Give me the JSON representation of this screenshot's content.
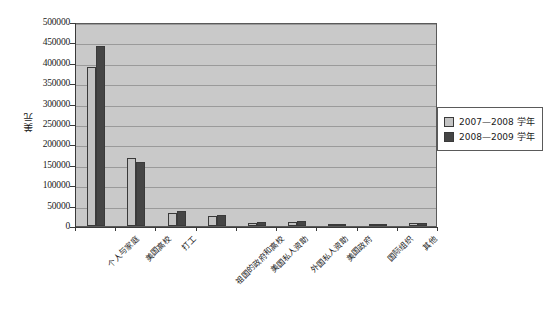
{
  "chart_data": {
    "type": "bar",
    "title": "",
    "xlabel": "",
    "ylabel": "美元",
    "ylim": [
      0,
      500000
    ],
    "ytick_labels": [
      "500000",
      "450000",
      "400000",
      "350000",
      "300000",
      "250000",
      "200000",
      "150000",
      "100000",
      "50000",
      "0"
    ],
    "ytick_values": [
      500000,
      450000,
      400000,
      350000,
      300000,
      250000,
      200000,
      150000,
      100000,
      50000,
      0
    ],
    "grid": true,
    "legend_position": "right",
    "categories": [
      "个人与家庭",
      "美国高校",
      "打工",
      "祖国的政府和高校",
      "美国私人资助",
      "外国私人资助",
      "美国政府",
      "国际组织",
      "其他"
    ],
    "series": [
      {
        "name": "2007—2008 学年",
        "color": "#c3c3c3",
        "values": [
          390000,
          167000,
          31000,
          25000,
          8000,
          11000,
          5000,
          2500,
          7000
        ]
      },
      {
        "name": "2008—2009 学年",
        "color": "#454545",
        "values": [
          440000,
          157000,
          36000,
          28000,
          9000,
          12000,
          5500,
          2800,
          8000
        ]
      }
    ]
  },
  "legend": {
    "items": [
      {
        "label": "2007—2008 学年",
        "swatch": "light-gray"
      },
      {
        "label": "2008—2009 学年",
        "swatch": "dark-gray"
      }
    ]
  },
  "colors": {
    "plot_background": "#c9c9c9",
    "gridline": "#9a9a9a",
    "axis": "#3a3a3a",
    "series_1": "#c3c3c3",
    "series_2": "#454545",
    "page_background": "#ffffff"
  }
}
